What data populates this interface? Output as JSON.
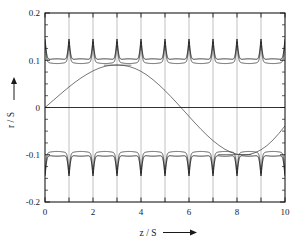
{
  "figure": {
    "name": "beam-envelope-trajectory-plot",
    "background": "#ffffff",
    "frame_color": "#1a1a1a"
  },
  "axes": {
    "x": {
      "label": "z / S",
      "label_arrow": "→",
      "min": 0,
      "max": 10,
      "major_ticks": [
        0,
        1,
        2,
        3,
        4,
        5,
        6,
        7,
        8,
        9,
        10
      ],
      "tick_labels": [
        "0",
        "",
        "2",
        "",
        "4",
        "",
        "6",
        "",
        "8",
        "",
        "10"
      ],
      "labeled_ticks": [
        0,
        2,
        4,
        6,
        8,
        10
      ],
      "minor_tick_step": 1,
      "grid": true
    },
    "y": {
      "label": "r / S",
      "label_arrow": "↑",
      "min": -0.2,
      "max": 0.2,
      "major_ticks": [
        -0.2,
        -0.1,
        0,
        0.1,
        0.2
      ],
      "tick_labels": [
        "-0.2",
        "-0.1",
        "0",
        "0.1",
        "0.2"
      ],
      "minor_tick_step": 0.025,
      "grid": true
    }
  },
  "chart_data": {
    "type": "line",
    "title": "",
    "subtitle": "",
    "xlabel": "z / S",
    "ylabel": "r / S",
    "xlim": [
      0,
      10
    ],
    "ylim": [
      -0.2,
      0.2
    ],
    "xticks": [
      0,
      1,
      2,
      3,
      4,
      5,
      6,
      7,
      8,
      9,
      10
    ],
    "xticklabels": [
      "0",
      "",
      "2",
      "",
      "4",
      "",
      "6",
      "",
      "8",
      "",
      "10"
    ],
    "yticks": [
      -0.2,
      -0.1,
      0.0,
      0.1,
      0.2
    ],
    "yticklabels": [
      "-0.2",
      "-0.1",
      "0",
      "0.1",
      "0.2"
    ],
    "grid": true,
    "legend": null,
    "legend_position": "none",
    "annotations": [],
    "series": [
      {
        "name": "upper-envelope",
        "color": "#1a1a1a",
        "linewidth": 0.9,
        "comment": "baseline ~ +0.100 with slight sag to +0.097 mid-cell; sharp spikes to +0.145 at each integer z",
        "baseline": 0.1,
        "sag": 0.003,
        "spike_peak": 0.145,
        "spike_half_width": 0.06,
        "spike_positions": [
          0,
          1,
          2,
          3,
          4,
          5,
          6,
          7,
          8,
          9,
          10
        ]
      },
      {
        "name": "lower-envelope",
        "color": "#1a1a1a",
        "linewidth": 0.9,
        "comment": "mirror of upper envelope about r/S = 0",
        "baseline": -0.1,
        "sag": -0.003,
        "spike_peak": -0.145,
        "spike_half_width": 0.06,
        "spike_positions": [
          0,
          1,
          2,
          3,
          4,
          5,
          6,
          7,
          8,
          9,
          10
        ]
      },
      {
        "name": "upper-inner-envelope",
        "color": "#1a1a1a",
        "linewidth": 0.7,
        "comment": "second, slightly thinner envelope line tracing just inside the outer one",
        "baseline": 0.0965,
        "spike_peak": 0.138,
        "spike_half_width": 0.05
      },
      {
        "name": "lower-inner-envelope",
        "color": "#1a1a1a",
        "linewidth": 0.7,
        "baseline": -0.0965,
        "spike_peak": -0.138,
        "spike_half_width": 0.05
      },
      {
        "name": "particle-trajectory",
        "color": "#3b3b3b",
        "linewidth": 0.7,
        "comment": "slow betatron oscillation of a single particle, sampled at z/S intervals of 0.25",
        "x": [
          0.0,
          0.25,
          0.5,
          0.75,
          1.0,
          1.25,
          1.5,
          1.75,
          2.0,
          2.25,
          2.5,
          2.75,
          3.0,
          3.25,
          3.5,
          3.75,
          4.0,
          4.25,
          4.5,
          4.75,
          5.0,
          5.25,
          5.5,
          5.75,
          6.0,
          6.25,
          6.5,
          6.75,
          7.0,
          7.25,
          7.5,
          7.75,
          8.0,
          8.25,
          8.5,
          8.75,
          9.0,
          9.25,
          9.5,
          9.75,
          10.0
        ],
        "y": [
          0.0,
          0.011,
          0.022,
          0.033,
          0.0435,
          0.0535,
          0.0625,
          0.0705,
          0.0775,
          0.0832,
          0.0872,
          0.0895,
          0.0902,
          0.0893,
          0.0868,
          0.0826,
          0.0765,
          0.0685,
          0.0588,
          0.0478,
          0.0358,
          0.0228,
          0.0092,
          -0.0048,
          -0.0188,
          -0.0328,
          -0.0462,
          -0.0588,
          -0.0702,
          -0.0802,
          -0.0885,
          -0.0948,
          -0.0988,
          -0.1005,
          -0.0995,
          -0.0958,
          -0.0895,
          -0.0805,
          -0.0688,
          -0.0548,
          -0.0388
        ]
      },
      {
        "name": "trajectory-plateau-marker",
        "color": "#3b3b3b",
        "linewidth": 0.6,
        "comment": "short horizontal tick-like segments where the trajectory turns over",
        "segments": [
          {
            "x0": 2.45,
            "x1": 3.6,
            "y": 0.0895
          },
          {
            "x0": 7.2,
            "x1": 8.6,
            "y": -0.0995
          }
        ]
      }
    ]
  }
}
